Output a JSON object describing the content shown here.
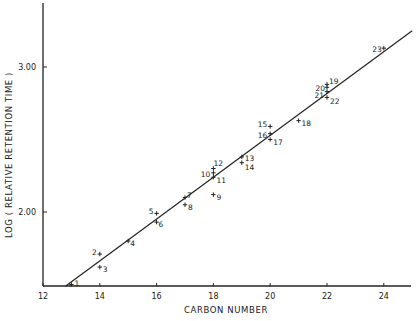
{
  "chart_data": {
    "type": "scatter",
    "title": "",
    "xlabel": "CARBON NUMBER",
    "ylabel": "LOG ( RELATIVE RETENTION TIME )",
    "xlim": [
      12,
      25
    ],
    "ylim": [
      1.49,
      3.48
    ],
    "x_ticks": [
      12,
      14,
      16,
      18,
      20,
      22,
      24
    ],
    "x_tick_labels": [
      "12",
      "14",
      "16",
      "18",
      "20",
      "22",
      "24"
    ],
    "y_ticks": [
      2.0,
      3.0
    ],
    "y_tick_labels": [
      "2.00",
      "3.00"
    ],
    "grid": false,
    "legend": null,
    "series": [
      {
        "name": "compounds",
        "marker": "+",
        "points": [
          {
            "label": "1",
            "x": 13,
            "y": 1.5
          },
          {
            "label": "2",
            "x": 14,
            "y": 1.71
          },
          {
            "label": "3",
            "x": 14,
            "y": 1.62
          },
          {
            "label": "4",
            "x": 15,
            "y": 1.8
          },
          {
            "label": "5",
            "x": 16,
            "y": 1.99
          },
          {
            "label": "6",
            "x": 16,
            "y": 1.93
          },
          {
            "label": "7",
            "x": 17,
            "y": 2.1
          },
          {
            "label": "8",
            "x": 17,
            "y": 2.05
          },
          {
            "label": "9",
            "x": 18,
            "y": 2.12
          },
          {
            "label": "10",
            "x": 18,
            "y": 2.27
          },
          {
            "label": "11",
            "x": 18,
            "y": 2.24
          },
          {
            "label": "12",
            "x": 18,
            "y": 2.3
          },
          {
            "label": "13",
            "x": 19,
            "y": 2.38
          },
          {
            "label": "14",
            "x": 19,
            "y": 2.34
          },
          {
            "label": "15",
            "x": 20,
            "y": 2.59
          },
          {
            "label": "16",
            "x": 20,
            "y": 2.54
          },
          {
            "label": "17",
            "x": 20,
            "y": 2.5
          },
          {
            "label": "18",
            "x": 21,
            "y": 2.63
          },
          {
            "label": "19",
            "x": 22,
            "y": 2.88
          },
          {
            "label": "20",
            "x": 22,
            "y": 2.86
          },
          {
            "label": "21",
            "x": 22,
            "y": 2.83
          },
          {
            "label": "22",
            "x": 22,
            "y": 2.79
          },
          {
            "label": "23",
            "x": 24,
            "y": 3.13
          }
        ]
      }
    ],
    "fit_line": {
      "x_start": 12.8,
      "y_start": 1.49,
      "x_end": 25,
      "y_end": 3.25
    }
  }
}
